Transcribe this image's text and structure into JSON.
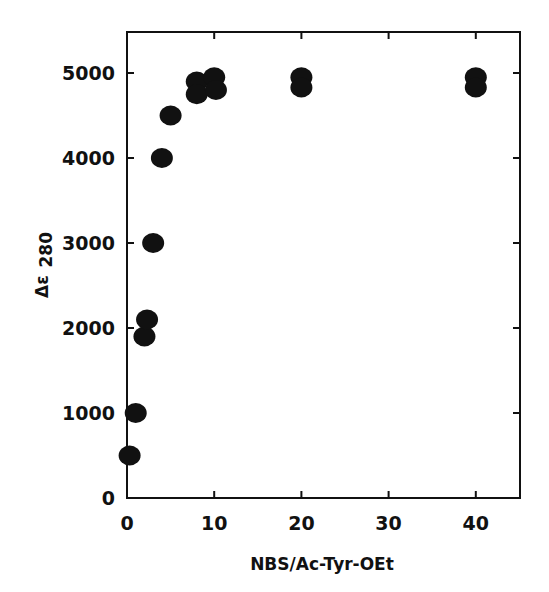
{
  "chart_data": {
    "type": "scatter",
    "title": "",
    "xlabel": "NBS/Ac-Tyr-OEt",
    "ylabel": "Δε 280",
    "ylabel_main": "Δε",
    "ylabel_sub": "280",
    "xlim": [
      0,
      45
    ],
    "ylim": [
      0,
      5500
    ],
    "xticks": [
      0,
      10,
      20,
      30,
      40
    ],
    "yticks": [
      0,
      1000,
      2000,
      3000,
      4000,
      5000
    ],
    "xtick_labels": [
      "0",
      "10",
      "20",
      "30",
      "40"
    ],
    "ytick_labels": [
      "0",
      "1000",
      "2000",
      "3000",
      "4000",
      "5000"
    ],
    "grid": false,
    "legend": null,
    "marker": "filled-circle",
    "marker_color": "#111111",
    "series": [
      {
        "name": "data",
        "points": [
          {
            "x": 0.3,
            "y": 500
          },
          {
            "x": 1.0,
            "y": 1000
          },
          {
            "x": 2.0,
            "y": 1900
          },
          {
            "x": 2.3,
            "y": 2100
          },
          {
            "x": 3.0,
            "y": 3000
          },
          {
            "x": 4.0,
            "y": 4000
          },
          {
            "x": 5.0,
            "y": 4500
          },
          {
            "x": 8.0,
            "y": 4900
          },
          {
            "x": 8.0,
            "y": 4750
          },
          {
            "x": 10.0,
            "y": 4950
          },
          {
            "x": 10.2,
            "y": 4800
          },
          {
            "x": 20.0,
            "y": 4950
          },
          {
            "x": 20.0,
            "y": 4830
          },
          {
            "x": 40.0,
            "y": 4950
          },
          {
            "x": 40.0,
            "y": 4830
          }
        ]
      }
    ]
  }
}
